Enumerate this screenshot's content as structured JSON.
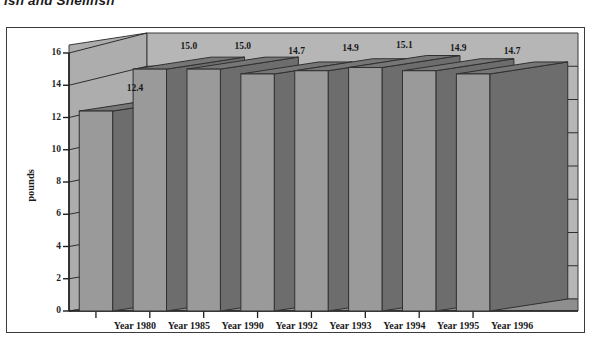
{
  "chart_data": {
    "type": "bar",
    "title": "ish and Shellfish",
    "subtitle": "",
    "xlabel": "",
    "ylabel": "pounds",
    "categories": [
      "Year 1980",
      "Year 1985",
      "Year 1990",
      "Year 1992",
      "Year 1993",
      "Year 1994",
      "Year 1995",
      "Year 1996"
    ],
    "values": [
      12.4,
      15.0,
      15.0,
      14.7,
      14.9,
      15.1,
      14.9,
      14.7
    ],
    "data_labels": [
      "12.4",
      "15.0",
      "15.0",
      "14.7",
      "14.9",
      "15.1",
      "14.9",
      "14.7"
    ],
    "ylim": [
      0,
      16
    ],
    "ytick_values": [
      0,
      2,
      4,
      6,
      8,
      10,
      12,
      14,
      16
    ],
    "ytick_labels": [
      "0",
      "2",
      "4",
      "6",
      "8",
      "10",
      "12",
      "14",
      "16"
    ],
    "grid": true,
    "grid_axis": "y",
    "legend": false,
    "legend_position": "none",
    "three_d": true,
    "colors": {
      "bar_front": "#9a9a9a",
      "bar_side": "#6d6d6d",
      "bar_top": "#767676",
      "back_wall": "#b6b6b6",
      "side_wall": "#aaaaaa",
      "floor": "#8e8e8e",
      "frame_border": "#3b3b3b",
      "axis_line": "#2a2a2a",
      "grid_line": "#2e2e2e",
      "text": "#1a1a1a",
      "page_background": "#ffffff"
    }
  }
}
